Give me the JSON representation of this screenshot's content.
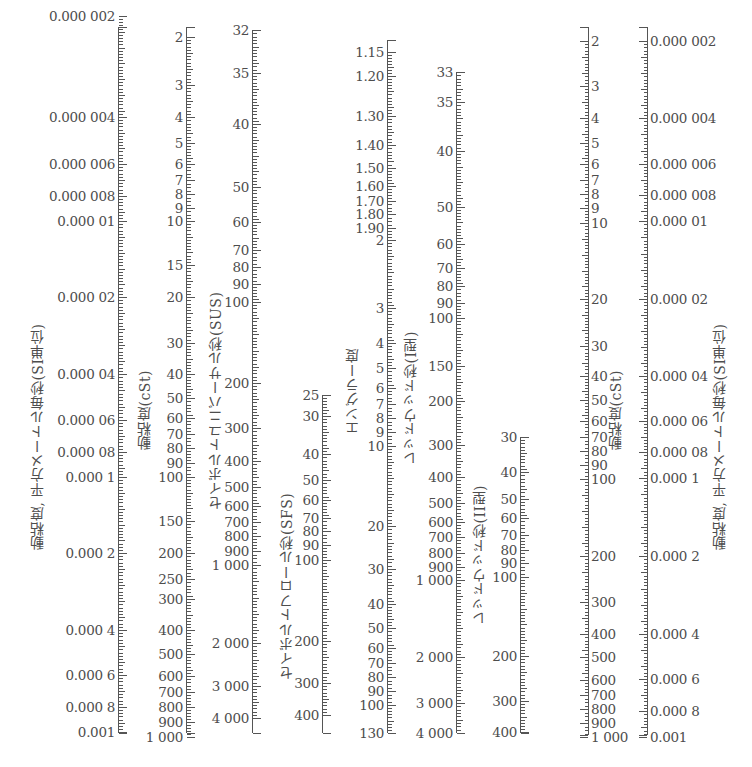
{
  "chart_data": {
    "type": "table",
    "scales": [
      {
        "id": "si_left",
        "title": "動粘度, 平方メートル毎秒(SI単位)",
        "unit": "m²/s",
        "x": 36,
        "title_x": 36,
        "title_y": 160,
        "title_len": 390,
        "side": "left",
        "ticks": [
          {
            "label": "0.000 002",
            "y": 16
          },
          {
            "label": "0.000 004",
            "y": 117
          },
          {
            "label": "0.000 006",
            "y": 164
          },
          {
            "label": "0.000 008",
            "y": 196
          },
          {
            "label": "0.000 01",
            "y": 221
          },
          {
            "label": "0.000 02",
            "y": 297
          },
          {
            "label": "0.000 04",
            "y": 374
          },
          {
            "label": "0.000 06",
            "y": 420
          },
          {
            "label": "0.000 08",
            "y": 452
          },
          {
            "label": "0.000 1",
            "y": 477
          },
          {
            "label": "0.000 2",
            "y": 553
          },
          {
            "label": "0.000 4",
            "y": 630
          },
          {
            "label": "0.000 6",
            "y": 675
          },
          {
            "label": "0.000 8",
            "y": 707
          },
          {
            "label": "0.001",
            "y": 732
          }
        ],
        "axis_x": 118,
        "y_top": 27,
        "y_bot": 733
      },
      {
        "id": "cst_left",
        "title": "動粘度(cSt)",
        "unit": "cSt",
        "title_x": 143,
        "title_y": 350,
        "title_len": 100,
        "side": "left",
        "ticks": [
          {
            "label": "2",
            "y": 37
          },
          {
            "label": "3",
            "y": 85
          },
          {
            "label": "4",
            "y": 117
          },
          {
            "label": "5",
            "y": 143
          },
          {
            "label": "6",
            "y": 164
          },
          {
            "label": "7",
            "y": 180
          },
          {
            "label": "8",
            "y": 194
          },
          {
            "label": "9",
            "y": 208
          },
          {
            "label": "10",
            "y": 221
          },
          {
            "label": "15",
            "y": 265
          },
          {
            "label": "20",
            "y": 297
          },
          {
            "label": "30",
            "y": 343
          },
          {
            "label": "40",
            "y": 374
          },
          {
            "label": "50",
            "y": 398
          },
          {
            "label": "60",
            "y": 418
          },
          {
            "label": "70",
            "y": 434
          },
          {
            "label": "80",
            "y": 448
          },
          {
            "label": "90",
            "y": 463
          },
          {
            "label": "100",
            "y": 477
          },
          {
            "label": "150",
            "y": 521
          },
          {
            "label": "200",
            "y": 553
          },
          {
            "label": "250",
            "y": 579
          },
          {
            "label": "300",
            "y": 599
          },
          {
            "label": "400",
            "y": 630
          },
          {
            "label": "500",
            "y": 654
          },
          {
            "label": "600",
            "y": 676
          },
          {
            "label": "700",
            "y": 692
          },
          {
            "label": "800",
            "y": 707
          },
          {
            "label": "900",
            "y": 722
          },
          {
            "label": "1 000",
            "y": 737
          }
        ],
        "axis_x": 186,
        "y_top": 27,
        "y_bot": 733
      },
      {
        "id": "sus",
        "title": "セイボルトユニバーサル秒(SUS)",
        "unit": "SUS",
        "title_x": 214,
        "title_y": 250,
        "title_len": 260,
        "side": "left",
        "ticks": [
          {
            "label": "32",
            "y": 30
          },
          {
            "label": "35",
            "y": 73
          },
          {
            "label": "40",
            "y": 124
          },
          {
            "label": "50",
            "y": 187
          },
          {
            "label": "60",
            "y": 222
          },
          {
            "label": "70",
            "y": 250
          },
          {
            "label": "80",
            "y": 267
          },
          {
            "label": "90",
            "y": 284
          },
          {
            "label": "100",
            "y": 302
          },
          {
            "label": "200",
            "y": 383
          },
          {
            "label": "300",
            "y": 428
          },
          {
            "label": "400",
            "y": 461
          },
          {
            "label": "500",
            "y": 487
          },
          {
            "label": "600",
            "y": 506
          },
          {
            "label": "700",
            "y": 522
          },
          {
            "label": "800",
            "y": 536
          },
          {
            "label": "900",
            "y": 551
          },
          {
            "label": "1 000",
            "y": 565
          },
          {
            "label": "2 000",
            "y": 643
          },
          {
            "label": "3 000",
            "y": 686
          },
          {
            "label": "4 000",
            "y": 718
          }
        ],
        "axis_x": 252,
        "y_top": 30,
        "y_bot": 733
      },
      {
        "id": "sfs",
        "title": "セイボルトフロール秒(SFS)",
        "unit": "SFS",
        "title_x": 285,
        "title_y": 470,
        "title_len": 210,
        "side": "left",
        "ticks": [
          {
            "label": "25",
            "y": 395
          },
          {
            "label": "30",
            "y": 416
          },
          {
            "label": "40",
            "y": 454
          },
          {
            "label": "50",
            "y": 480
          },
          {
            "label": "60",
            "y": 500
          },
          {
            "label": "70",
            "y": 518
          },
          {
            "label": "80",
            "y": 531
          },
          {
            "label": "90",
            "y": 545
          },
          {
            "label": "100",
            "y": 560
          },
          {
            "label": "200",
            "y": 641
          },
          {
            "label": "300",
            "y": 683
          },
          {
            "label": "400",
            "y": 715
          }
        ],
        "axis_x": 322,
        "y_top": 395,
        "y_bot": 733
      },
      {
        "id": "engler",
        "title": "エングラー度",
        "unit": "°E",
        "title_x": 351,
        "title_y": 340,
        "title_len": 95,
        "side": "left",
        "ticks": [
          {
            "label": "1.15",
            "y": 52
          },
          {
            "label": "1.20",
            "y": 76
          },
          {
            "label": "1.30",
            "y": 116
          },
          {
            "label": "1.40",
            "y": 145
          },
          {
            "label": "1.50",
            "y": 168
          },
          {
            "label": "1.60",
            "y": 186
          },
          {
            "label": "1.70",
            "y": 201
          },
          {
            "label": "1.80",
            "y": 214
          },
          {
            "label": "1.90",
            "y": 228
          },
          {
            "label": "2",
            "y": 240
          },
          {
            "label": "3",
            "y": 308
          },
          {
            "label": "4",
            "y": 343
          },
          {
            "label": "5",
            "y": 368
          },
          {
            "label": "6",
            "y": 388
          },
          {
            "label": "7",
            "y": 404
          },
          {
            "label": "8",
            "y": 418
          },
          {
            "label": "9",
            "y": 432
          },
          {
            "label": "10",
            "y": 446
          },
          {
            "label": "20",
            "y": 526
          },
          {
            "label": "30",
            "y": 569
          },
          {
            "label": "40",
            "y": 604
          },
          {
            "label": "50",
            "y": 628
          },
          {
            "label": "60",
            "y": 648
          },
          {
            "label": "70",
            "y": 663
          },
          {
            "label": "80",
            "y": 677
          },
          {
            "label": "90",
            "y": 691
          },
          {
            "label": "100",
            "y": 705
          },
          {
            "label": "130",
            "y": 733
          }
        ],
        "axis_x": 387,
        "y_top": 40,
        "y_bot": 733
      },
      {
        "id": "redwood_1",
        "title": "レッドウッド秒(I型)",
        "unit": "s (Redwood No.1)",
        "title_x": 409,
        "title_y": 335,
        "title_len": 130,
        "side": "left",
        "ticks": [
          {
            "label": "33",
            "y": 72
          },
          {
            "label": "35",
            "y": 102
          },
          {
            "label": "40",
            "y": 151
          },
          {
            "label": "50",
            "y": 207
          },
          {
            "label": "60",
            "y": 244
          },
          {
            "label": "70",
            "y": 268
          },
          {
            "label": "80",
            "y": 286
          },
          {
            "label": "90",
            "y": 303
          },
          {
            "label": "100",
            "y": 318
          },
          {
            "label": "150",
            "y": 366
          },
          {
            "label": "200",
            "y": 401
          },
          {
            "label": "300",
            "y": 445
          },
          {
            "label": "400",
            "y": 477
          },
          {
            "label": "500",
            "y": 503
          },
          {
            "label": "600",
            "y": 522
          },
          {
            "label": "700",
            "y": 537
          },
          {
            "label": "800",
            "y": 553
          },
          {
            "label": "900",
            "y": 567
          },
          {
            "label": "1 000",
            "y": 580
          },
          {
            "label": "2 000",
            "y": 657
          },
          {
            "label": "3 000",
            "y": 703
          },
          {
            "label": "4 000",
            "y": 733
          }
        ],
        "axis_x": 456,
        "y_top": 72,
        "y_bot": 733
      },
      {
        "id": "redwood_2",
        "title": "レッドウッド秒(II型)",
        "unit": "s (Redwood No.2)",
        "title_x": 478,
        "title_y": 490,
        "title_len": 135,
        "side": "left",
        "ticks": [
          {
            "label": "30",
            "y": 437
          },
          {
            "label": "40",
            "y": 472
          },
          {
            "label": "50",
            "y": 499
          },
          {
            "label": "60",
            "y": 518
          },
          {
            "label": "70",
            "y": 535
          },
          {
            "label": "80",
            "y": 550
          },
          {
            "label": "90",
            "y": 563
          },
          {
            "label": "100",
            "y": 577
          },
          {
            "label": "200",
            "y": 656
          },
          {
            "label": "300",
            "y": 701
          },
          {
            "label": "400",
            "y": 732
          }
        ],
        "axis_x": 520,
        "y_top": 437,
        "y_bot": 733
      },
      {
        "id": "cst_right",
        "title": "動粘度(cSt)",
        "unit": "cSt",
        "title_x": 614,
        "title_y": 350,
        "title_len": 100,
        "side": "right",
        "ticks": [
          {
            "label": "2",
            "y": 41
          },
          {
            "label": "3",
            "y": 86
          },
          {
            "label": "4",
            "y": 118
          },
          {
            "label": "5",
            "y": 143
          },
          {
            "label": "6",
            "y": 164
          },
          {
            "label": "7",
            "y": 180
          },
          {
            "label": "8",
            "y": 194
          },
          {
            "label": "9",
            "y": 208
          },
          {
            "label": "10",
            "y": 223
          },
          {
            "label": "20",
            "y": 299
          },
          {
            "label": "30",
            "y": 346
          },
          {
            "label": "40",
            "y": 376
          },
          {
            "label": "50",
            "y": 400
          },
          {
            "label": "60",
            "y": 421
          },
          {
            "label": "70",
            "y": 437
          },
          {
            "label": "80",
            "y": 451
          },
          {
            "label": "90",
            "y": 465
          },
          {
            "label": "100",
            "y": 479
          },
          {
            "label": "200",
            "y": 556
          },
          {
            "label": "300",
            "y": 602
          },
          {
            "label": "400",
            "y": 634
          },
          {
            "label": "500",
            "y": 657
          },
          {
            "label": "600",
            "y": 680
          },
          {
            "label": "700",
            "y": 695
          },
          {
            "label": "800",
            "y": 709
          },
          {
            "label": "900",
            "y": 723
          },
          {
            "label": "1 000",
            "y": 737
          }
        ],
        "axis_x": 588,
        "y_top": 27,
        "y_bot": 735
      },
      {
        "id": "si_right",
        "title": "動粘度, 平方メートル毎秒(SI単位)",
        "unit": "m²/s",
        "title_x": 718,
        "title_y": 160,
        "title_len": 390,
        "side": "right",
        "ticks": [
          {
            "label": "0.000 002",
            "y": 41
          },
          {
            "label": "0.000 004",
            "y": 118
          },
          {
            "label": "0.000 006",
            "y": 164
          },
          {
            "label": "0.000 008",
            "y": 195
          },
          {
            "label": "0.000 01",
            "y": 221
          },
          {
            "label": "0.000 02",
            "y": 299
          },
          {
            "label": "0.000 04",
            "y": 376
          },
          {
            "label": "0.000 06",
            "y": 421
          },
          {
            "label": "0.000 08",
            "y": 452
          },
          {
            "label": "0.000 1",
            "y": 478
          },
          {
            "label": "0.000 2",
            "y": 556
          },
          {
            "label": "0.000 4",
            "y": 634
          },
          {
            "label": "0.000 6",
            "y": 679
          },
          {
            "label": "0.000 8",
            "y": 711
          },
          {
            "label": "0.001",
            "y": 737
          }
        ],
        "axis_x": 647,
        "y_top": 27,
        "y_bot": 735
      }
    ]
  }
}
